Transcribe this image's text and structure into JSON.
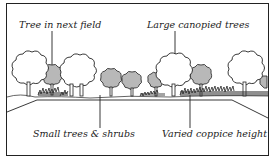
{
  "diagram": {
    "labels": {
      "tree_next_field": "Tree in next field",
      "large_canopied": "Large canopied trees",
      "small_trees_shrubs": "Small trees & shrubs",
      "varied_coppice": "Varied coppice height"
    },
    "colors": {
      "outline": "#222222",
      "grey_tree_fill": "#b8b8b8",
      "white_tree_fill": "#ffffff",
      "background": "#ffffff"
    }
  }
}
